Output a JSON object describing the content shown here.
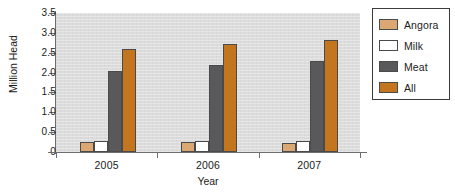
{
  "chart_data": {
    "type": "bar",
    "title": "",
    "xlabel": "Year",
    "ylabel": "Million Head",
    "categories": [
      "2005",
      "2006",
      "2007"
    ],
    "series": [
      {
        "name": "Angora",
        "color": "#DBA873",
        "values": [
          0.26,
          0.25,
          0.22
        ]
      },
      {
        "name": "Milk",
        "color": "#FFFFFF",
        "values": [
          0.27,
          0.27,
          0.27
        ]
      },
      {
        "name": "Meat",
        "color": "#59595B",
        "values": [
          2.05,
          2.19,
          2.29
        ]
      },
      {
        "name": "All",
        "color": "#C4761E",
        "values": [
          2.6,
          2.72,
          2.82
        ]
      }
    ],
    "ylim": [
      0,
      3.5
    ],
    "ytick_labels": [
      "3.5",
      "3.0",
      "2.5",
      "2.0",
      "1.5",
      "1.0",
      "0.5",
      "0"
    ],
    "ytick_values": [
      3.5,
      3.0,
      2.5,
      2.0,
      1.5,
      1.0,
      0.5,
      0
    ],
    "grid": false,
    "legend_position": "right",
    "plot_background": "#DCDCDC",
    "axis_color": "#6D6D6D",
    "bar_border_color": "#4A4A4A"
  },
  "legend": {
    "items": [
      {
        "label": "Angora",
        "color": "#DBA873"
      },
      {
        "label": "Milk",
        "color": "#FFFFFF"
      },
      {
        "label": "Meat",
        "color": "#59595B"
      },
      {
        "label": "All",
        "color": "#C4761E"
      }
    ]
  }
}
